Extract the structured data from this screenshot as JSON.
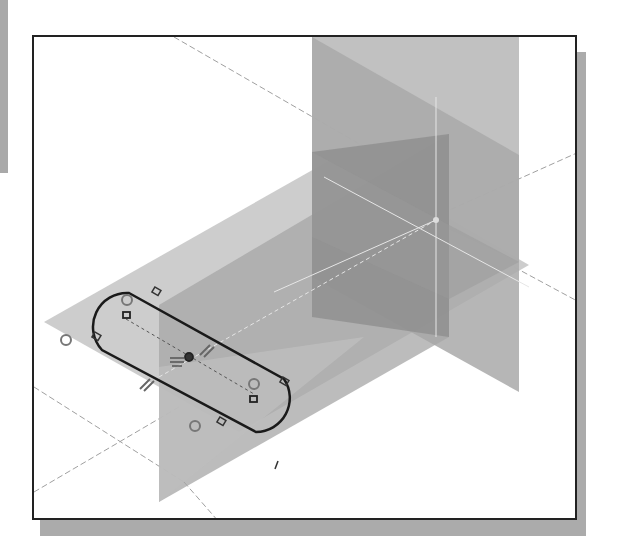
{
  "figure": {
    "colors": {
      "background": "#ffffff",
      "frame_border": "#222222",
      "frame_shadow": "#ababab",
      "plane_light": "#c4c4c4",
      "plane_mid": "#a8a8a8",
      "plane_dark": "#8e8e8e",
      "sketch_line": "#1a1a1a",
      "axis_line": "#9a9a9a"
    },
    "elements": {
      "horizontal_plane": "XY datum plane",
      "vertical_plane_front": "XZ datum plane",
      "vertical_plane_side": "YZ datum plane",
      "slot_sketch": "Slot profile (two arcs, two lines)",
      "constraints": [
        "tangent",
        "tangent",
        "tangent",
        "tangent",
        "parallel",
        "parallel",
        "horizontal",
        "concentric",
        "concentric",
        "center point"
      ]
    }
  }
}
